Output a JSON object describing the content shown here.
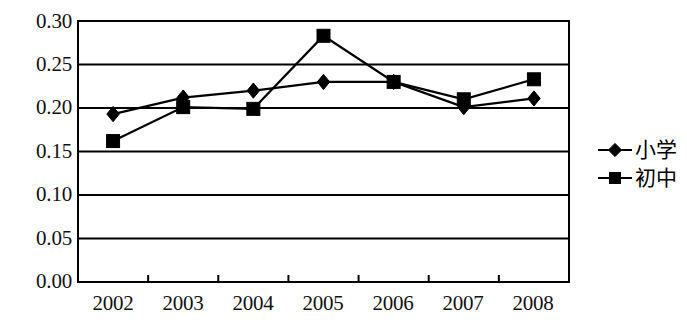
{
  "chart_data": {
    "type": "line",
    "title": "",
    "subtitle": "",
    "xlabel": "",
    "ylabel": "",
    "categories": [
      "2002",
      "2003",
      "2004",
      "2005",
      "2006",
      "2007",
      "2008"
    ],
    "series": [
      {
        "name": "小学",
        "marker": "diamond",
        "color": "#000000",
        "values": [
          0.193,
          0.212,
          0.22,
          0.23,
          0.23,
          0.201,
          0.211
        ]
      },
      {
        "name": "初中",
        "marker": "square",
        "color": "#000000",
        "values": [
          0.162,
          0.201,
          0.199,
          0.283,
          0.23,
          0.21,
          0.233
        ]
      }
    ],
    "ylim": [
      0.0,
      0.3
    ],
    "ytick_labels": [
      "0.30",
      "0.25",
      "0.20",
      "0.15",
      "0.10",
      "0.05",
      "0.00"
    ],
    "ytick_values": [
      0.3,
      0.25,
      0.2,
      0.15,
      0.1,
      0.05,
      0.0
    ],
    "grid": true,
    "grid_axis": "y",
    "legend_position": "right",
    "plot_background": "#ffffff",
    "axis_color": "#000000",
    "grid_color": "#000000"
  },
  "legend": {
    "items": [
      {
        "label": "小学",
        "marker": "diamond"
      },
      {
        "label": "初中",
        "marker": "square"
      }
    ]
  }
}
